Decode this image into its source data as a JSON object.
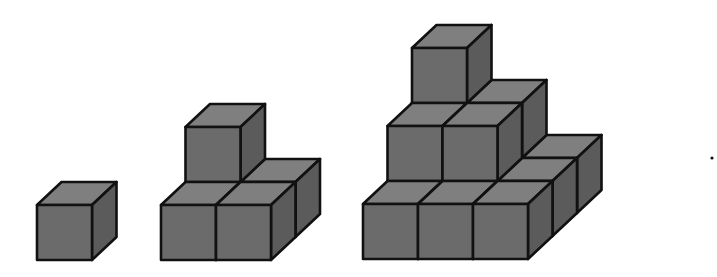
{
  "diagram": {
    "cube_size": 55,
    "depth_offset": [
      24.5,
      -23
    ],
    "colors": {
      "top": "#7f7f7f",
      "front": "#6b6b6b",
      "side": "#5b5b5b",
      "edge": "#111111",
      "background": "#ffffff"
    },
    "figures": [
      {
        "id": "figure-1",
        "levels": 1,
        "cube_count": 1,
        "origin": [
          37,
          260
        ],
        "cubes": [
          [
            0,
            0,
            0
          ]
        ]
      },
      {
        "id": "figure-2",
        "levels": 2,
        "cube_count": 5,
        "origin": [
          161,
          260
        ],
        "cubes": [
          [
            0,
            1,
            0
          ],
          [
            1,
            1,
            0
          ],
          [
            0,
            0,
            0
          ],
          [
            1,
            0,
            0
          ],
          [
            0,
            1,
            1
          ]
        ]
      },
      {
        "id": "figure-3",
        "levels": 3,
        "cube_count": 14,
        "origin": [
          363,
          259
        ],
        "cubes": [
          [
            0,
            2,
            0
          ],
          [
            1,
            2,
            0
          ],
          [
            2,
            2,
            0
          ],
          [
            0,
            1,
            0
          ],
          [
            1,
            1,
            0
          ],
          [
            2,
            1,
            0
          ],
          [
            0,
            0,
            0
          ],
          [
            1,
            0,
            0
          ],
          [
            2,
            0,
            0
          ],
          [
            0,
            2,
            1
          ],
          [
            1,
            2,
            1
          ],
          [
            0,
            1,
            1
          ],
          [
            1,
            1,
            1
          ],
          [
            0,
            2,
            2
          ]
        ]
      }
    ],
    "continuation_dot": {
      "x": 712,
      "y": 158,
      "r": 1.6
    }
  }
}
